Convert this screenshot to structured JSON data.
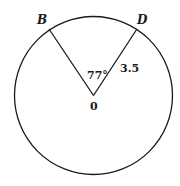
{
  "diagram": {
    "type": "circle-sector",
    "circle": {
      "cx": 93.5,
      "cy": 95.5,
      "r": 79
    },
    "center": {
      "label": "0",
      "x": 93.5,
      "y": 95.5
    },
    "points": [
      {
        "id": "B",
        "label": "B",
        "x": 49,
        "y": 29
      },
      {
        "id": "D",
        "label": "D",
        "x": 137,
        "y": 29
      }
    ],
    "angle_label": "77°",
    "radius_label": "3.5",
    "stroke_color": "#1a1a1a",
    "background": "#ffffff"
  }
}
